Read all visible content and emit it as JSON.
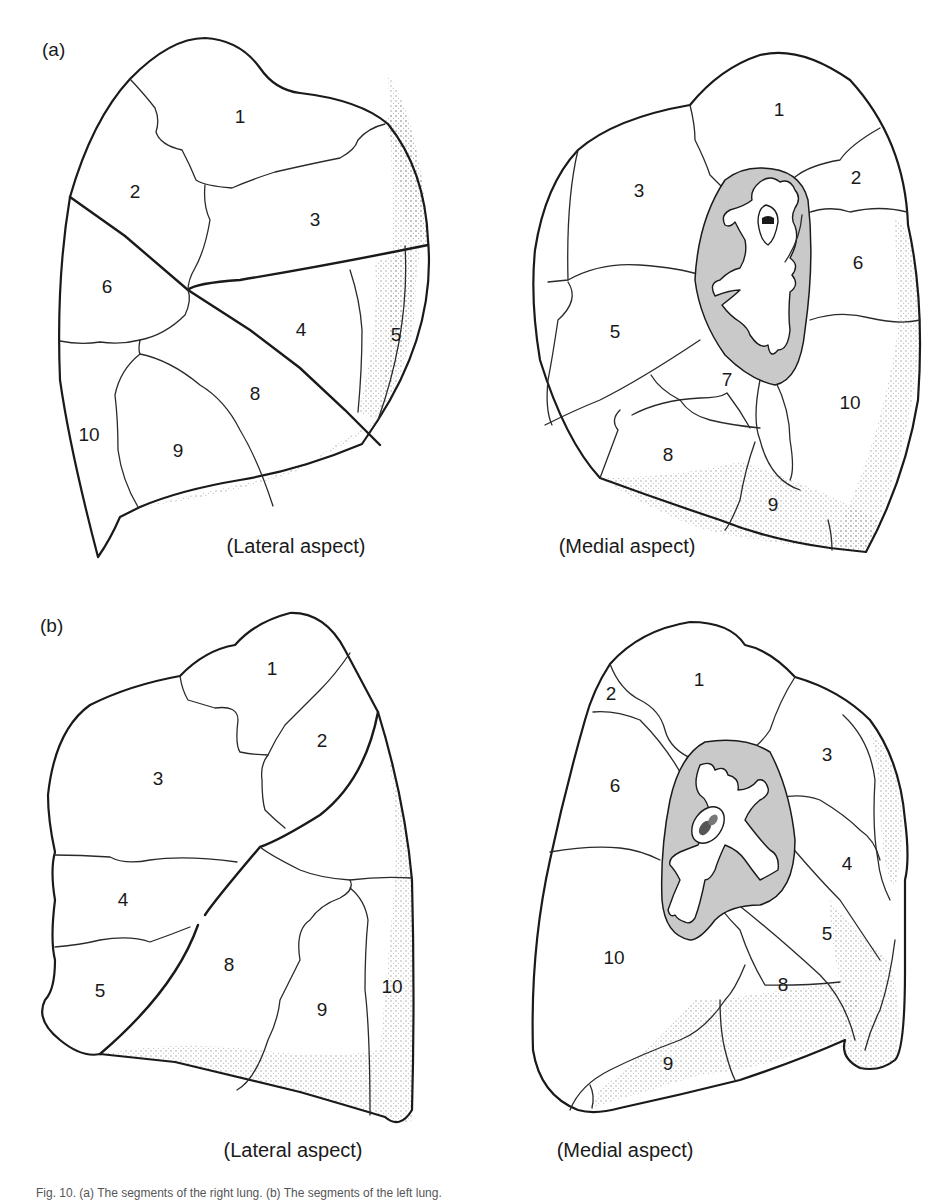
{
  "figure": {
    "colors": {
      "line": "#1a1a1a",
      "hilum_fill": "#c9c9c9",
      "stipple": "#9a9a9a",
      "background": "#ffffff"
    },
    "caption": "Fig. 10. (a) The segments of the right lung. (b) The segments of the left lung.",
    "panels": [
      {
        "id": "a",
        "label": "(a)",
        "views": [
          {
            "aspect": "(Lateral aspect)",
            "segments": [
              {
                "num": "1",
                "x": 240,
                "y": 118
              },
              {
                "num": "2",
                "x": 135,
                "y": 193
              },
              {
                "num": "3",
                "x": 315,
                "y": 221
              },
              {
                "num": "6",
                "x": 107,
                "y": 288
              },
              {
                "num": "4",
                "x": 301,
                "y": 331
              },
              {
                "num": "5",
                "x": 396,
                "y": 336
              },
              {
                "num": "8",
                "x": 255,
                "y": 395
              },
              {
                "num": "10",
                "x": 89,
                "y": 436
              },
              {
                "num": "9",
                "x": 178,
                "y": 452
              }
            ]
          },
          {
            "aspect": "(Medial aspect)",
            "segments": [
              {
                "num": "1",
                "x": 779,
                "y": 111
              },
              {
                "num": "2",
                "x": 856,
                "y": 179
              },
              {
                "num": "3",
                "x": 639,
                "y": 192
              },
              {
                "num": "6",
                "x": 858,
                "y": 264
              },
              {
                "num": "5",
                "x": 615,
                "y": 333
              },
              {
                "num": "7",
                "x": 727,
                "y": 381
              },
              {
                "num": "10",
                "x": 850,
                "y": 404
              },
              {
                "num": "8",
                "x": 668,
                "y": 456
              },
              {
                "num": "9",
                "x": 773,
                "y": 506
              }
            ]
          }
        ]
      },
      {
        "id": "b",
        "label": "(b)",
        "views": [
          {
            "aspect": "(Lateral aspect)",
            "segments": [
              {
                "num": "1",
                "x": 272,
                "y": 670
              },
              {
                "num": "2",
                "x": 322,
                "y": 742
              },
              {
                "num": "3",
                "x": 158,
                "y": 780
              },
              {
                "num": "4",
                "x": 123,
                "y": 901
              },
              {
                "num": "5",
                "x": 100,
                "y": 992
              },
              {
                "num": "8",
                "x": 229,
                "y": 966
              },
              {
                "num": "9",
                "x": 322,
                "y": 1011
              },
              {
                "num": "10",
                "x": 392,
                "y": 988
              }
            ]
          },
          {
            "aspect": "(Medial aspect)",
            "segments": [
              {
                "num": "1",
                "x": 699,
                "y": 681
              },
              {
                "num": "2",
                "x": 611,
                "y": 695
              },
              {
                "num": "3",
                "x": 827,
                "y": 756
              },
              {
                "num": "6",
                "x": 615,
                "y": 787
              },
              {
                "num": "4",
                "x": 847,
                "y": 865
              },
              {
                "num": "5",
                "x": 827,
                "y": 935
              },
              {
                "num": "10",
                "x": 614,
                "y": 959
              },
              {
                "num": "8",
                "x": 783,
                "y": 986
              },
              {
                "num": "9",
                "x": 668,
                "y": 1065
              }
            ]
          }
        ]
      }
    ]
  }
}
